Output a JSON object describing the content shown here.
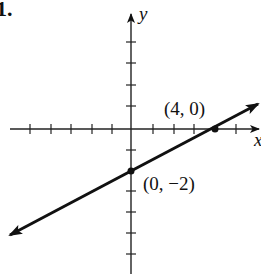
{
  "problem_number": "1.",
  "axes": {
    "x_label": "x",
    "y_label": "y"
  },
  "points": [
    {
      "label": "(4, 0)",
      "x": 4,
      "y": 0
    },
    {
      "label": "(0, −2)",
      "x": 0,
      "y": -2
    }
  ],
  "line": {
    "slope": 0.5,
    "intercept": -2,
    "equation": "y = 0.5x - 2",
    "color": "#111111"
  },
  "grid": {
    "x_ticks": [
      -5,
      -4,
      -3,
      -2,
      -1,
      1,
      2,
      3,
      4,
      5
    ],
    "y_ticks": [
      4,
      3,
      2,
      1,
      -1,
      -2,
      -3,
      -4,
      -5,
      -6
    ]
  }
}
